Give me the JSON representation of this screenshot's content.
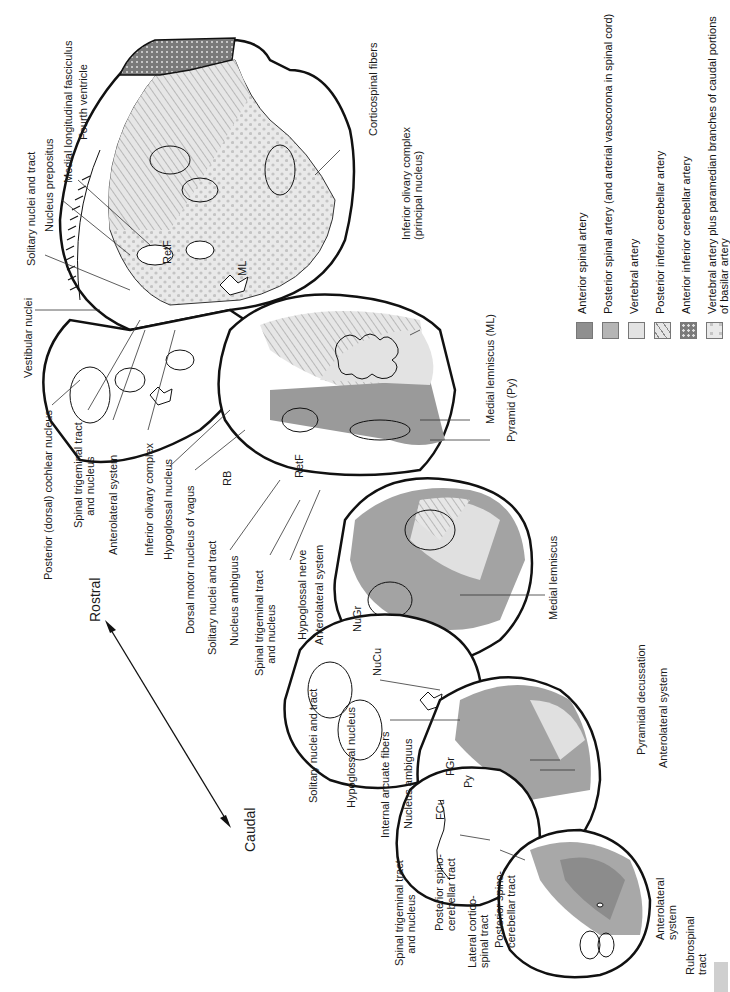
{
  "figure": {
    "orientation": {
      "rostral": "Rostral",
      "caudal": "Caudal"
    },
    "section_labels": {
      "retf_upper": "RetF",
      "ml_upper": "ML",
      "retf_mid": "RetF",
      "rb": "RB",
      "nugr": "NuGr",
      "nucu": "NuCu",
      "py": "Py",
      "fgr": "FGr",
      "fcu": "FCu"
    },
    "labels": {
      "medial_longitudinal_fasciculus": "Medial longitudinal fasciculus",
      "fourth_ventricle": "Fourth ventricle",
      "nucleus_prepositus": "Nucleus prepositus",
      "solitary_nuclei_tract_1": "Solitary nuclei and tract",
      "vestibular_nuclei": "Vestibular nuclei",
      "posterior_cochlear_nucleus": "Posterior (dorsal) cochlear nucleus",
      "spinal_trigeminal_1": "Spinal trigeminal tract\n    and nucleus",
      "anterolateral_system_1": "Anterolateral system",
      "inferior_olivary_complex": "Inferior olivary complex",
      "hypoglossal_nucleus_1": "Hypoglossal nucleus",
      "dorsal_motor_nucleus_vagus": "Dorsal motor nucleus of vagus",
      "solitary_nuclei_tract_2": "Solitary nuclei and tract",
      "nucleus_ambiguus_1": "Nucleus ambiguus",
      "spinal_trigeminal_2": "Spinal trigeminal tract\n    and nucleus",
      "hypoglossal_nerve": "Hypoglossal nerve",
      "anterolateral_system_2": "Anterolateral system",
      "corticospinal_fibers": "Corticospinal fibers",
      "inferior_olivary_principal": "Inferior olivary complex\n(principal nucleus)",
      "medial_lemniscus_ml": "Medial lemniscus (ML)",
      "pyramid_py": "Pyramid (Py)",
      "medial_lemniscus": "Medial lemniscus",
      "solitary_nuclei_tract_3": "Solitary nuclei and tract",
      "hypoglossal_nucleus_2": "Hypoglossal nucleus",
      "internal_arcuate_fibers": "Internal arcuate fibers",
      "nucleus_ambiguus_2": "Nucleus ambiguus",
      "pyramidal_decussation": "Pyramidal decussation",
      "anterolateral_system_3": "Anterolateral system",
      "spinal_trigeminal_3": "Spinal trigeminal tract\n    and nucleus",
      "posterior_spinocerebellar_1": "Posterior spino-\ncerebellar tract",
      "lateral_corticospinal": "Lateral cortico-\nspinal tract",
      "posterior_spinocerebellar_2": "Posterior spino-\ncerebellar tract",
      "anterolateral_system_4": "Anterolateral\nsystem",
      "rubrospinal_tract": "Rubrospinal\ntract"
    },
    "legend": [
      {
        "label": "Anterior spinal artery",
        "pattern": "solid-dark",
        "color": "#8f8f8f"
      },
      {
        "label": "Posterior spinal artery (and arterial vasocorona in spinal cord)",
        "pattern": "solid-medium",
        "color": "#b5b5b5"
      },
      {
        "label": "Vertebral artery",
        "pattern": "solid-light",
        "color": "#e3e3e3"
      },
      {
        "label": "Posterior inferior cerebellar artery",
        "pattern": "diagonal-hatch",
        "color": "#d6d6d6"
      },
      {
        "label": "Anterior inferior cerebellar artery",
        "pattern": "dark-dotted",
        "color": "#7d7d7d"
      },
      {
        "label": "Vertebral artery plus paramedian branches of caudal portions\nof basilar artery",
        "pattern": "light-dotted",
        "color": "#e6e6e6"
      }
    ]
  }
}
